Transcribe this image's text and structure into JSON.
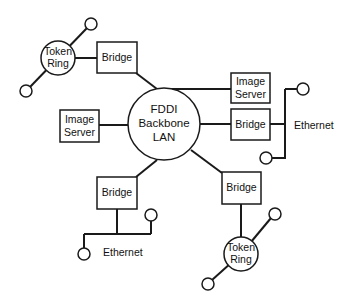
{
  "diagram": {
    "colors": {
      "stroke": "#1a1a1a",
      "background": "#ffffff",
      "text": "#111111"
    },
    "center": {
      "line1": "FDDI",
      "line2": "Backbone",
      "line3": "LAN"
    },
    "nodes": {
      "token_ring_top": {
        "line1": "Token",
        "line2": "Ring"
      },
      "bridge_top_left": {
        "label": "Bridge"
      },
      "image_server_left": {
        "line1": "Image",
        "line2": "Server"
      },
      "image_server_right": {
        "line1": "Image",
        "line2": "Server"
      },
      "bridge_right": {
        "label": "Bridge"
      },
      "ethernet_right": {
        "label": "Ethernet"
      },
      "bridge_bottom_left": {
        "label": "Bridge"
      },
      "ethernet_bottom": {
        "label": "Ethernet"
      },
      "bridge_bottom_right": {
        "label": "Bridge"
      },
      "token_ring_bottom": {
        "line1": "Token",
        "line2": "Ring"
      }
    },
    "station_icon": "small-circle-station"
  }
}
